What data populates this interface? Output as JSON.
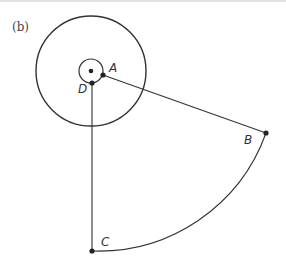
{
  "figure": {
    "panel_label": "(b)",
    "points": {
      "A": "A",
      "B": "B",
      "C": "C",
      "D": "D"
    },
    "colors": {
      "stroke": "#333333",
      "dot": "#222222"
    }
  }
}
